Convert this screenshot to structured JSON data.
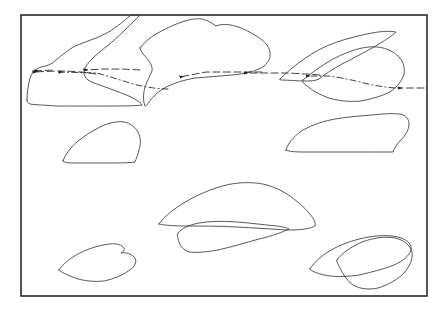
{
  "figure": {
    "type": "line-drawing-map",
    "background_color": "#ffffff",
    "ink_color": "#2a2a2a",
    "frame": {
      "name": "map-border",
      "x": 21,
      "y": 15,
      "width": 406,
      "height": 281,
      "stroke_color": "#2b2b2b",
      "stroke_width": 1.6
    },
    "landmasses": [
      {
        "id": "landmass-upper-left",
        "label": "",
        "position": "upper-left",
        "path": "M 27 100 L 30 74 L 38 68 L 48 66 L 57 57 L 66 50 L 78 44 L 90 40 L 101 36 L 112 31 L 122 24 L 131 15 L 140 15 L 131 27 L 120 37 L 110 45 L 100 52 L 92 58 L 86 66 L 83 74 L 88 80 L 96 84 L 107 87 L 118 91 L 128 95 L 137 100 L 142 105 L 133 106 L 120 106 L 104 106 L 88 106 L 70 106 L 52 105 L 38 104 Z"
      },
      {
        "id": "landmass-upper-center",
        "label": "",
        "position": "upper-center",
        "path": "M 139 47 L 146 40 L 155 34 L 165 29 L 176 24 L 188 21 L 199 19 L 209 21 L 216 26 L 224 24 L 233 25 L 243 29 L 252 34 L 261 40 L 268 47 L 270 55 L 266 62 L 258 68 L 247 72 L 235 74 L 222 75 L 209 76 L 196 77 L 184 79 L 173 82 L 164 86 L 156 91 L 150 97 L 146 104 L 143 96 L 144 87 L 148 79 L 152 72 L 150 65 L 144 58 Z"
      },
      {
        "id": "landmass-upper-right-a",
        "label": "",
        "position": "upper-right",
        "path": "M 279 78 L 288 70 L 298 62 L 309 55 L 320 49 L 332 44 L 344 40 L 356 37 L 368 34 L 379 32 L 389 31 L 396 33 L 391 38 L 381 44 L 370 50 L 358 56 L 347 61 L 337 66 L 328 71 L 320 76 L 314 80 L 305 80 L 294 79 Z"
      },
      {
        "id": "landmass-upper-right-b",
        "label": "",
        "position": "upper-right-lower",
        "path": "M 305 79 L 317 70 L 329 62 L 341 55 L 353 50 L 365 47 L 377 47 L 388 50 L 396 56 L 401 64 L 402 72 L 399 80 L 393 87 L 385 92 L 375 96 L 364 99 L 353 101 L 342 101 L 331 99 L 322 95 L 314 90 L 308 85 Z"
      },
      {
        "id": "landmass-mid-left",
        "label": "",
        "position": "mid-left",
        "path": "M 64 160 L 70 152 L 78 145 L 86 139 L 94 133 L 102 128 L 110 124 L 118 122 L 126 123 L 133 127 L 138 133 L 140 140 L 139 147 L 137 154 L 136 160 L 132 163 L 124 163 L 114 163 L 103 163 L 92 163 L 81 162 L 72 162 Z"
      },
      {
        "id": "landmass-mid-right",
        "label": "",
        "position": "mid-right",
        "path": "M 285 148 L 290 140 L 297 133 L 306 128 L 316 124 L 327 121 L 338 119 L 349 117 L 360 116 L 371 115 L 382 114 L 392 113 L 400 114 L 406 118 L 408 124 L 406 131 L 401 137 L 396 142 L 395 148 L 393 152 L 383 152 L 370 152 L 355 152 L 340 152 L 325 152 L 310 152 L 296 151 Z"
      },
      {
        "id": "landmass-center-lower-a",
        "label": "",
        "position": "center-lower",
        "path": "M 160 223 L 168 215 L 178 208 L 189 202 L 201 196 L 213 191 L 225 187 L 237 184 L 249 183 L 260 184 L 270 187 L 279 191 L 288 196 L 296 202 L 303 208 L 309 214 L 313 219 L 315 224 L 312 228 L 305 230 L 295 230 L 283 229 L 270 228 L 256 227 L 242 226 L 228 226 L 214 226 L 200 226 L 187 226 L 175 225 L 166 225 Z"
      },
      {
        "id": "landmass-center-lower-b",
        "label": "",
        "position": "center-lower-overlap",
        "path": "M 178 232 L 185 227 L 194 224 L 204 222 L 215 221 L 227 222 L 239 223 L 251 224 L 263 225 L 274 226 L 283 227 L 288 229 L 282 232 L 272 235 L 260 238 L 247 241 L 234 244 L 221 247 L 209 250 L 198 252 L 189 252 L 183 249 L 179 243 Z"
      },
      {
        "id": "landmass-bottom-left",
        "label": "",
        "position": "bottom-left",
        "path": "M 60 269 L 66 263 L 74 258 L 83 253 L 93 249 L 103 246 L 112 244 L 120 245 L 124 249 L 121 253 L 127 252 L 133 254 L 136 258 L 134 263 L 129 268 L 122 272 L 114 276 L 105 279 L 95 281 L 86 281 L 78 279 L 70 276 L 64 273 Z"
      },
      {
        "id": "landmass-bottom-right-a",
        "label": "",
        "position": "bottom-right",
        "path": "M 311 268 L 318 261 L 327 255 L 337 250 L 348 245 L 359 241 L 370 238 L 381 236 L 391 235 L 400 236 L 407 239 L 411 244 L 410 250 L 405 255 L 397 259 L 387 263 L 376 267 L 364 270 L 352 273 L 340 275 L 329 276 L 320 275 L 314 272 Z"
      },
      {
        "id": "landmass-bottom-right-b",
        "label": "",
        "position": "bottom-right-overlap",
        "path": "M 337 259 L 345 252 L 355 247 L 366 243 L 377 240 L 388 238 L 398 238 L 406 241 L 411 246 L 412 253 L 409 260 L 404 266 L 397 272 L 389 277 L 380 282 L 371 286 L 362 288 L 354 287 L 348 283 L 344 277 L 340 270 Z"
      }
    ],
    "flow_arrows": [
      {
        "id": "flow-arrow-1",
        "direction": "leftward",
        "style": "dashed",
        "description": "westward flow entering upper-left landmass"
      },
      {
        "id": "flow-arrow-2",
        "direction": "leftward",
        "style": "dashed",
        "description": "westward flow across upper-left region"
      },
      {
        "id": "flow-arrow-3",
        "direction": "leftward",
        "style": "dash-dot",
        "description": "westward flow along lower branch of upper-left landmass"
      },
      {
        "id": "flow-arrow-4",
        "direction": "leftward",
        "style": "dashed",
        "description": "westward flow across upper-center channel"
      },
      {
        "id": "flow-arrow-5",
        "direction": "leftward",
        "style": "dashed",
        "description": "westward flow from right junction"
      },
      {
        "id": "flow-arrow-6",
        "direction": "leftward",
        "style": "dash-dot",
        "description": "westward flow along upper-right lower branch"
      },
      {
        "id": "flow-arrow-7",
        "direction": "leftward",
        "style": "dashed",
        "description": "westward flow entering from right edge"
      }
    ],
    "legend": {
      "visible": false,
      "items": []
    },
    "axis": {
      "visible": false
    },
    "caption": ""
  }
}
